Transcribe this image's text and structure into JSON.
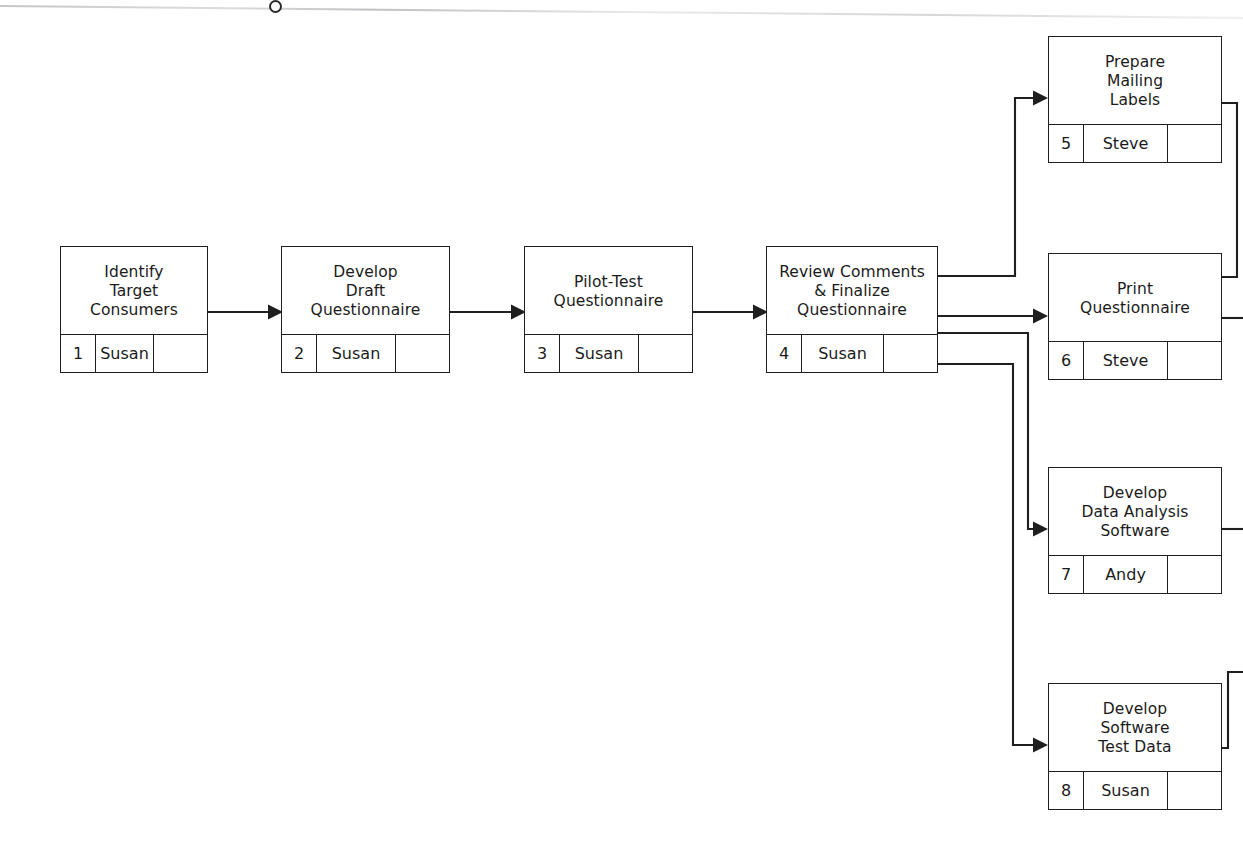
{
  "page": {
    "background_color": "#ffffff",
    "line_color": "#1f1f1f",
    "scan_rule_present": true
  },
  "nodes": [
    {
      "id": "task-1",
      "title": "Identify\nTarget\nConsumers",
      "number": "1",
      "owner": "Susan",
      "extra": ""
    },
    {
      "id": "task-2",
      "title": "Develop\nDraft\nQuestionnaire",
      "number": "2",
      "owner": "Susan",
      "extra": ""
    },
    {
      "id": "task-3",
      "title": "Pilot-Test\nQuestionnaire",
      "number": "3",
      "owner": "Susan",
      "extra": ""
    },
    {
      "id": "task-4",
      "title": "Review Comments\n& Finalize\nQuestionnaire",
      "number": "4",
      "owner": "Susan",
      "extra": ""
    },
    {
      "id": "task-5",
      "title": "Prepare\nMailing\nLabels",
      "number": "5",
      "owner": "Steve",
      "extra": ""
    },
    {
      "id": "task-6",
      "title": "Print\nQuestionnaire",
      "number": "6",
      "owner": "Steve",
      "extra": ""
    },
    {
      "id": "task-7",
      "title": "Develop\nData Analysis\nSoftware",
      "number": "7",
      "owner": "Andy",
      "extra": ""
    },
    {
      "id": "task-8",
      "title": "Develop\nSoftware\nTest Data",
      "number": "8",
      "owner": "Susan",
      "extra": ""
    }
  ],
  "edges": [
    {
      "id": "edge-1-2",
      "from": "task-1",
      "to": "task-2",
      "arrow": true
    },
    {
      "id": "edge-2-3",
      "from": "task-2",
      "to": "task-3",
      "arrow": true
    },
    {
      "id": "edge-3-4",
      "from": "task-3",
      "to": "task-4",
      "arrow": true
    },
    {
      "id": "edge-4-5",
      "from": "task-4",
      "to": "task-5",
      "arrow": true
    },
    {
      "id": "edge-4-6",
      "from": "task-4",
      "to": "task-6",
      "arrow": true
    },
    {
      "id": "edge-4-7",
      "from": "task-4",
      "to": "task-7",
      "arrow": true
    },
    {
      "id": "edge-4-8",
      "from": "task-4",
      "to": "task-8",
      "arrow": true
    },
    {
      "id": "edge-5-out",
      "from": "task-5",
      "to": "off-page",
      "arrow": false
    },
    {
      "id": "edge-6-out",
      "from": "task-6",
      "to": "off-page",
      "arrow": false
    },
    {
      "id": "edge-7-out",
      "from": "task-7",
      "to": "off-page",
      "arrow": false
    },
    {
      "id": "edge-8-out",
      "from": "task-8",
      "to": "off-page",
      "arrow": false
    }
  ]
}
